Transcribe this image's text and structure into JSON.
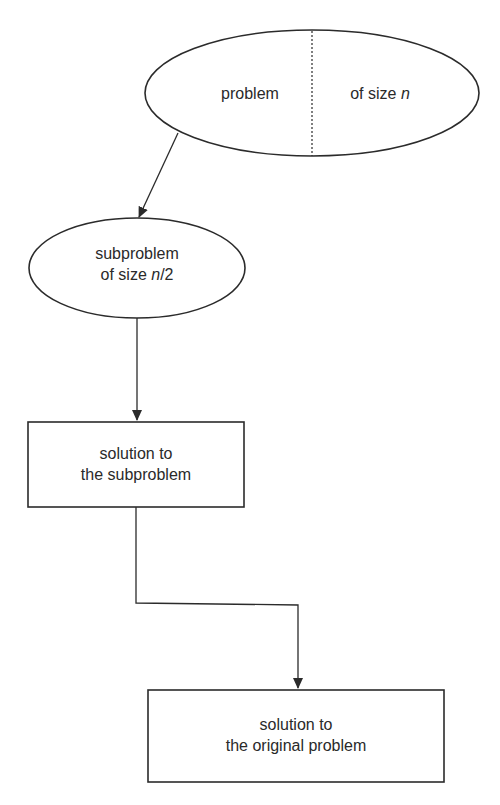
{
  "diagram": {
    "nodes": {
      "problem": {
        "shape": "ellipse",
        "left_text": "problem",
        "right_text_prefix": "of size ",
        "right_text_var": "n"
      },
      "subproblem": {
        "shape": "ellipse",
        "line1": "subproblem",
        "line2_prefix": "of size ",
        "line2_var": "n",
        "line2_suffix": "/2"
      },
      "sub_solution": {
        "shape": "rectangle",
        "line1": "solution to",
        "line2": "the subproblem"
      },
      "orig_solution": {
        "shape": "rectangle",
        "line1": "solution to",
        "line2": "the original problem"
      }
    },
    "edges": [
      {
        "from": "problem",
        "to": "subproblem"
      },
      {
        "from": "subproblem",
        "to": "sub_solution"
      },
      {
        "from": "sub_solution",
        "to": "orig_solution"
      }
    ],
    "stroke_color": "#2b2b2b"
  }
}
